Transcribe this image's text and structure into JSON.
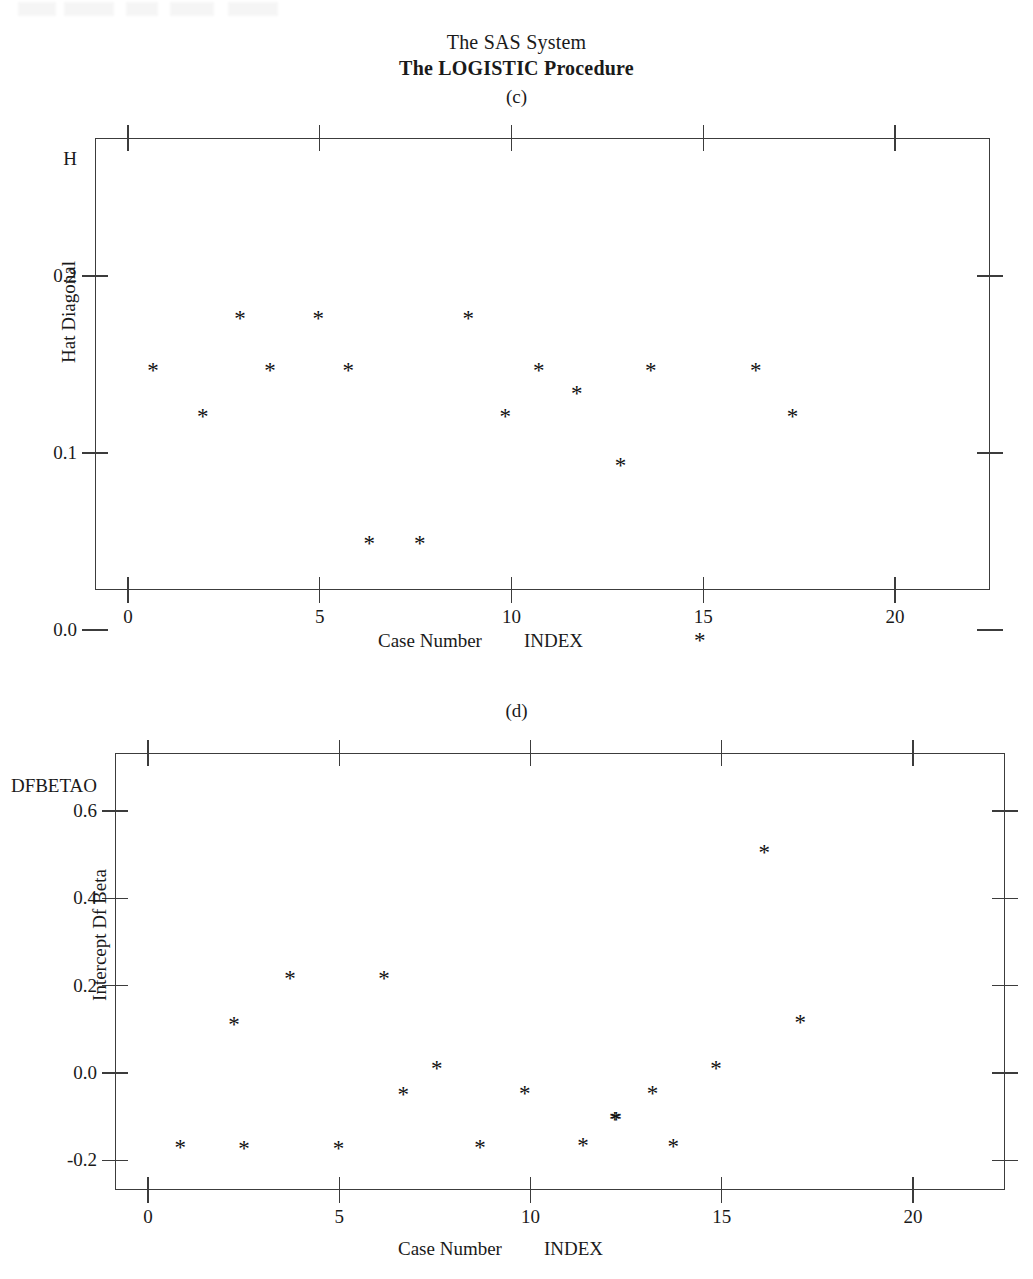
{
  "header": {
    "system_title": "The SAS System",
    "procedure_title": "The LOGISTIC Procedure"
  },
  "panels": [
    {
      "caption": "(c)",
      "y_variable_name": "H",
      "y_axis_title": "Hat Diagonal",
      "x_axis_title": "Case Number",
      "x_variable_name": "INDEX",
      "y_ticks": [
        "0.2",
        "0.1",
        "0.0"
      ],
      "x_ticks": [
        "0",
        "5",
        "10",
        "15",
        "20"
      ]
    },
    {
      "caption": "(d)",
      "y_variable_name": "DFBETAO",
      "y_axis_title": "Intercept Df Beta",
      "x_axis_title": "Case Number",
      "x_variable_name": "INDEX",
      "y_ticks": [
        "0.6",
        "0.4",
        "0.2",
        "0.0",
        "-0.2"
      ],
      "x_ticks": [
        "0",
        "5",
        "10",
        "15",
        "20"
      ]
    }
  ],
  "chart_data": [
    {
      "type": "scatter",
      "title": "(c)",
      "xlabel": "Case Number",
      "ylabel": "Hat Diagonal",
      "x_variable": "INDEX",
      "y_variable": "H",
      "marker": "*",
      "grid": false,
      "legend": "none",
      "xlim": [
        -0.85,
        22.5
      ],
      "ylim": [
        -0.033,
        0.232
      ],
      "xticks": [
        0,
        5,
        10,
        15,
        20
      ],
      "yticks": [
        0.2,
        0.1,
        0.0
      ],
      "points": [
        {
          "x": 0.65,
          "y": 0.15
        },
        {
          "x": 1.95,
          "y": 0.124
        },
        {
          "x": 2.92,
          "y": 0.179
        },
        {
          "x": 3.7,
          "y": 0.15
        },
        {
          "x": 4.96,
          "y": 0.179
        },
        {
          "x": 5.74,
          "y": 0.15
        },
        {
          "x": 6.29,
          "y": 0.052
        },
        {
          "x": 7.61,
          "y": 0.052
        },
        {
          "x": 8.87,
          "y": 0.179
        },
        {
          "x": 9.84,
          "y": 0.124
        },
        {
          "x": 10.71,
          "y": 0.15
        },
        {
          "x": 11.7,
          "y": 0.137
        },
        {
          "x": 12.84,
          "y": 0.096
        },
        {
          "x": 13.63,
          "y": 0.15
        },
        {
          "x": 14.91,
          "y": -0.003
        },
        {
          "x": 16.37,
          "y": 0.15
        },
        {
          "x": 17.33,
          "y": 0.124
        }
      ]
    },
    {
      "type": "scatter",
      "title": "(d)",
      "xlabel": "Case Number",
      "ylabel": "Intercept Df Beta",
      "x_variable": "INDEX",
      "y_variable": "DFBETAO",
      "marker": "*",
      "grid": false,
      "legend": "none",
      "xlim": [
        -0.86,
        23.2
      ],
      "ylim": [
        -0.31,
        0.71
      ],
      "xticks": [
        0,
        5,
        10,
        15,
        20
      ],
      "yticks": [
        0.6,
        0.4,
        0.2,
        0.0,
        -0.2
      ],
      "points": [
        {
          "x": 0.84,
          "y": -0.158
        },
        {
          "x": 2.25,
          "y": 0.124
        },
        {
          "x": 2.51,
          "y": -0.16
        },
        {
          "x": 3.71,
          "y": 0.23
        },
        {
          "x": 4.98,
          "y": -0.16
        },
        {
          "x": 6.17,
          "y": 0.23
        },
        {
          "x": 6.67,
          "y": -0.036
        },
        {
          "x": 7.55,
          "y": 0.022
        },
        {
          "x": 8.68,
          "y": -0.158
        },
        {
          "x": 9.85,
          "y": -0.035
        },
        {
          "x": 11.37,
          "y": -0.153
        },
        {
          "x": 12.24,
          "y": -0.095
        },
        {
          "x": 12.2,
          "y": -0.095
        },
        {
          "x": 13.19,
          "y": -0.035
        },
        {
          "x": 13.73,
          "y": -0.155
        },
        {
          "x": 14.85,
          "y": 0.022
        },
        {
          "x": 16.11,
          "y": 0.518
        },
        {
          "x": 17.05,
          "y": 0.128
        }
      ]
    }
  ]
}
